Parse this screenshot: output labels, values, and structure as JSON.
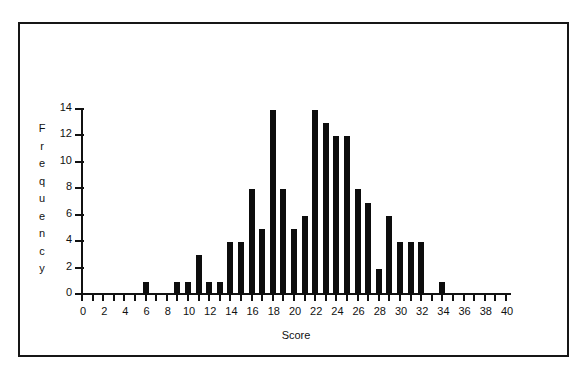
{
  "figure": {
    "border_color": "#161616",
    "background": "#ffffff",
    "bar_color": "#0d0d0d"
  },
  "chart_data": {
    "type": "bar",
    "title": "",
    "subtitle": "",
    "xlabel": "Score",
    "ylabel": "Frequency",
    "ylabel_letters": [
      "F",
      "r",
      "e",
      "q",
      "u",
      "e",
      "n",
      "c",
      "y"
    ],
    "xlim": [
      0,
      40
    ],
    "ylim": [
      0,
      14
    ],
    "grid": false,
    "legend": null,
    "x_tick_step": 1,
    "x_label_step": 2,
    "y_tick_step": 2,
    "xticks": [
      0,
      1,
      2,
      3,
      4,
      5,
      6,
      7,
      8,
      9,
      10,
      11,
      12,
      13,
      14,
      15,
      16,
      17,
      18,
      19,
      20,
      21,
      22,
      23,
      24,
      25,
      26,
      27,
      28,
      29,
      30,
      31,
      32,
      33,
      34,
      35,
      36,
      37,
      38,
      39,
      40
    ],
    "xtick_labels": [
      "0",
      "2",
      "4",
      "6",
      "8",
      "10",
      "12",
      "14",
      "16",
      "18",
      "20",
      "22",
      "24",
      "26",
      "28",
      "30",
      "32",
      "34",
      "36",
      "38",
      "40"
    ],
    "xtick_label_values": [
      0,
      2,
      4,
      6,
      8,
      10,
      12,
      14,
      16,
      18,
      20,
      22,
      24,
      26,
      28,
      30,
      32,
      34,
      36,
      38,
      40
    ],
    "yticks": [
      0,
      2,
      4,
      6,
      8,
      10,
      12,
      14
    ],
    "ytick_labels": [
      "0",
      "2",
      "4",
      "6",
      "8",
      "10",
      "12",
      "14"
    ],
    "categories": [
      0,
      1,
      2,
      3,
      4,
      5,
      6,
      7,
      8,
      9,
      10,
      11,
      12,
      13,
      14,
      15,
      16,
      17,
      18,
      19,
      20,
      21,
      22,
      23,
      24,
      25,
      26,
      27,
      28,
      29,
      30,
      31,
      32,
      33,
      34,
      35,
      36,
      37,
      38,
      39,
      40
    ],
    "values": [
      0,
      0,
      0,
      0,
      0,
      0,
      1,
      0,
      0,
      1,
      1,
      3,
      1,
      1,
      4,
      4,
      8,
      5,
      14,
      8,
      5,
      6,
      14,
      13,
      12,
      12,
      8,
      7,
      2,
      6,
      4,
      4,
      4,
      0,
      1,
      0,
      0,
      0,
      0,
      0,
      0
    ]
  }
}
